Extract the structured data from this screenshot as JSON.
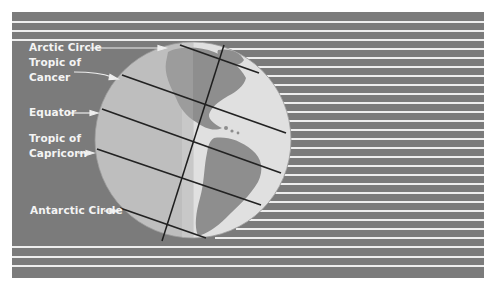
{
  "diagram": {
    "colors": {
      "background_panel": "#7b7b7b",
      "sun_rays": "#eeeeee",
      "globe_ocean": "#c2c2c2",
      "globe_land": "#8e8e8e",
      "globe_lit": "#e2e2e2",
      "lines": "#222222",
      "label_text": "#f4f4f4"
    },
    "labels": [
      {
        "id": "arctic-circle",
        "lines": [
          "Arctic Circle"
        ]
      },
      {
        "id": "tropic-of-cancer",
        "lines": [
          "Tropic of",
          "Cancer"
        ]
      },
      {
        "id": "equator",
        "lines": [
          "Equator"
        ]
      },
      {
        "id": "tropic-of-capricorn",
        "lines": [
          "Tropic of",
          "Capricorn"
        ]
      },
      {
        "id": "antarctic-circle",
        "lines": [
          "Antarctic Circle"
        ]
      }
    ]
  }
}
